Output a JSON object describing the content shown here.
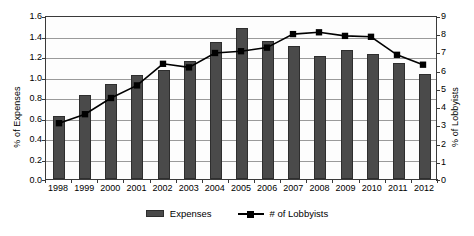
{
  "chart_data": {
    "type": "bar",
    "title": "",
    "subtitle": "",
    "xlabel": "",
    "ylabel": "% of Expenses",
    "y2label": "% of Lobbyists",
    "grid": true,
    "legend_position": "bottom",
    "categories": [
      "1998",
      "1999",
      "2000",
      "2001",
      "2002",
      "2003",
      "2004",
      "2005",
      "2006",
      "2007",
      "2008",
      "2009",
      "2010",
      "2011",
      "2012"
    ],
    "ylim": [
      0.0,
      1.6
    ],
    "y2lim": [
      0,
      9
    ],
    "yticks": [
      "1.6",
      "1.4",
      "1.2",
      "1.0",
      "0.8",
      "0.6",
      "0.4",
      "0.2",
      "0.0"
    ],
    "ytick_values": [
      1.6,
      1.4,
      1.2,
      1.0,
      0.8,
      0.6,
      0.4,
      0.2,
      0.0
    ],
    "y2ticks": [
      "9",
      "8",
      "7",
      "6",
      "5",
      "4",
      "3",
      "2",
      "1",
      "0"
    ],
    "y2tick_values": [
      9,
      8,
      7,
      6,
      5,
      4,
      3,
      2,
      1,
      0
    ],
    "series": [
      {
        "name": "Expenses",
        "kind": "bar",
        "axis": "left",
        "color": "#4a4a4a",
        "values": [
          0.61,
          0.82,
          0.93,
          1.01,
          1.06,
          1.15,
          1.34,
          1.47,
          1.35,
          1.3,
          1.2,
          1.26,
          1.22,
          1.13,
          1.02
        ]
      },
      {
        "name": "# of Lobbyists",
        "kind": "line",
        "axis": "right",
        "color": "#000000",
        "marker": "square",
        "values": [
          3.1,
          3.6,
          4.5,
          5.2,
          6.4,
          6.2,
          7.0,
          7.1,
          7.3,
          8.05,
          8.15,
          7.95,
          7.9,
          6.9,
          6.35
        ]
      }
    ]
  },
  "legend": {
    "items": [
      {
        "label": "Expenses",
        "type": "bar"
      },
      {
        "label": "# of Lobbyists",
        "type": "line"
      }
    ]
  }
}
